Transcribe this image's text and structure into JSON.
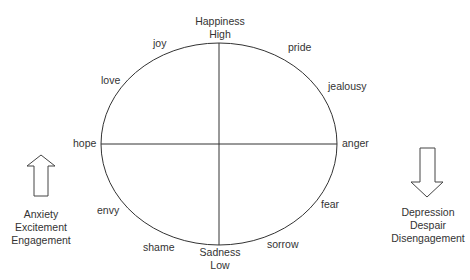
{
  "axes": {
    "top": [
      "Happiness",
      "High"
    ],
    "bottom": [
      "Sadness",
      "Low"
    ]
  },
  "emotions": {
    "joy": "joy",
    "love": "love",
    "hope": "hope",
    "envy": "envy",
    "shame": "shame",
    "pride": "pride",
    "jealousy": "jealousy",
    "anger": "anger",
    "fear": "fear",
    "sorrow": "sorrow"
  },
  "left_arrow": {
    "direction": "up",
    "labels": [
      "Anxiety",
      "Excitement",
      "Engagement"
    ]
  },
  "right_arrow": {
    "direction": "down",
    "labels": [
      "Depression",
      "Despair",
      "Disengagement"
    ]
  },
  "colors": {
    "stroke": "#333333",
    "text": "#333333",
    "background": "#ffffff"
  }
}
